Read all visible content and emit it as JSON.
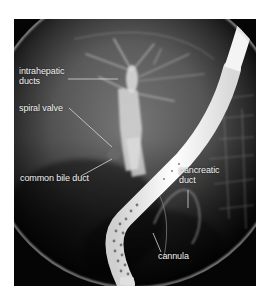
{
  "figure": {
    "type": "fluoroscopic x-ray (cholangiogram)",
    "labels": [
      {
        "id": "intrahepatic-ducts",
        "line1": "intrahepatic",
        "line2": "ducts"
      },
      {
        "id": "spiral-valve",
        "line1": "spiral valve"
      },
      {
        "id": "common-bile-duct",
        "line1": "common bile duct"
      },
      {
        "id": "pancreatic-duct",
        "line1": "pancreatic",
        "line2": "duct"
      },
      {
        "id": "cannula",
        "line1": "cannula"
      }
    ],
    "colors": {
      "background": "#ffffff",
      "image_frame": "#050505",
      "label_text": "#f2f2f2",
      "leader_line": "#d8d8d8"
    }
  }
}
